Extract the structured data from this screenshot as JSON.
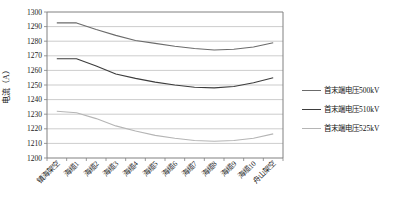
{
  "chart_data": {
    "type": "line",
    "title": "",
    "xlabel": "",
    "ylabel": "电流（A）",
    "ylim": [
      1200,
      1300
    ],
    "ytick_step": 10,
    "grid": true,
    "legend_position": "right",
    "categories": [
      "镇海架空",
      "海缆1",
      "海缆2",
      "海缆3",
      "海缆4",
      "海缆5",
      "海缆6",
      "海缆7",
      "海缆8",
      "海缆9",
      "海缆10",
      "舟山架空"
    ],
    "series": [
      {
        "name": "首末端电压500kV",
        "color": "#6b6b6b",
        "values": [
          1292.5,
          1292.5,
          1288,
          1284,
          1280.5,
          1278.5,
          1276.5,
          1275,
          1274,
          1274.5,
          1276,
          1279
        ]
      },
      {
        "name": "首末端电压510kV",
        "color": "#3d3d3d",
        "values": [
          1268,
          1268,
          1263,
          1257.5,
          1254.5,
          1252,
          1250,
          1248.5,
          1248,
          1249,
          1251.5,
          1255
        ]
      },
      {
        "name": "首末端电压525kV",
        "color": "#b5b5b5",
        "values": [
          1232,
          1231,
          1227,
          1222,
          1218.5,
          1215.5,
          1213.5,
          1212,
          1211.5,
          1212,
          1213.5,
          1216.5
        ]
      }
    ]
  },
  "colors": {
    "background": "#ffffff",
    "axis": "#808080",
    "grid": "#a9a9a9",
    "text": "#1a1a1a"
  }
}
